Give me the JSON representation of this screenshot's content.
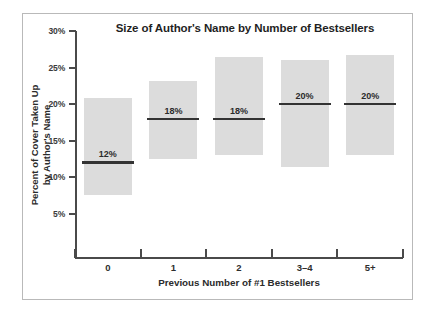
{
  "chart_data": {
    "type": "bar",
    "title": "Size of Author's Name by Number of Bestsellers",
    "xlabel": "Previous Number of #1 Bestsellers",
    "ylabel_line1": "Percent of Cover Taken Up",
    "ylabel_line2": "by Author's Name",
    "ylabel": "Percent of Cover Taken Up by Author's Name",
    "categories": [
      "0",
      "1",
      "2",
      "3–4",
      "5+"
    ],
    "ylim": [
      3.0,
      30.0
    ],
    "yticks": [
      30,
      25,
      20,
      15,
      10,
      5
    ],
    "ytick_labels": [
      "30%",
      "25%",
      "20%",
      "15%",
      "10%",
      "5%"
    ],
    "grid": false,
    "legend": "none",
    "value_labels": [
      "12%",
      "18%",
      "18%",
      "20%",
      "20%"
    ],
    "series": [
      {
        "name": "Median percent of cover taken up by author's name",
        "values": [
          12,
          18,
          18,
          20,
          20
        ]
      },
      {
        "name": "Range low",
        "values": [
          7.5,
          12.5,
          13.0,
          11.3,
          13.0
        ]
      },
      {
        "name": "Range high",
        "values": [
          20.8,
          23.2,
          26.5,
          26.0,
          26.7
        ]
      }
    ],
    "points": [
      {
        "category": "0",
        "median": 12,
        "median_label": "12%",
        "low": 7.5,
        "high": 20.8
      },
      {
        "category": "1",
        "median": 18,
        "median_label": "18%",
        "low": 12.5,
        "high": 23.2
      },
      {
        "category": "2",
        "median": 18,
        "median_label": "18%",
        "low": 13.0,
        "high": 26.5
      },
      {
        "category": "3–4",
        "median": 20,
        "median_label": "20%",
        "low": 11.3,
        "high": 26.0
      },
      {
        "category": "5+",
        "median": 20,
        "median_label": "20%",
        "low": 13.0,
        "high": 26.7
      }
    ],
    "colors": {
      "bar_fill": "#dcdcdc",
      "median_line": "#333333",
      "axis": "#4a4a4a",
      "text": "#2b2b2b",
      "frame": "#b9b9b9",
      "background": "#ffffff"
    }
  }
}
